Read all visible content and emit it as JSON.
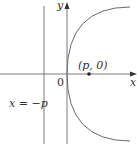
{
  "diagram": {
    "axes": {
      "x_label": "x",
      "y_label": "y",
      "origin_label": "0"
    },
    "focus": {
      "label": "(p, 0)"
    },
    "directrix": {
      "label": "x = −p"
    },
    "colors": {
      "line": "#7a7a7a",
      "curve": "#6a6a6a",
      "text": "#333333",
      "point": "#222222"
    }
  }
}
